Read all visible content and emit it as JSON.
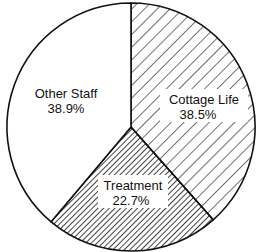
{
  "chart_data": {
    "type": "pie",
    "title": "",
    "start_angle_deg": 0,
    "direction": "clockwise",
    "categories": [
      "Cottage Life",
      "Treatment",
      "Other Staff"
    ],
    "values": [
      38.5,
      22.7,
      38.9
    ],
    "unit": "%",
    "slices": [
      {
        "label": "Cottage Life",
        "value": 38.5,
        "value_text": "38.5%",
        "fill": "sparse-diagonal-hatch"
      },
      {
        "label": "Treatment",
        "value": 22.7,
        "value_text": "22.7%",
        "fill": "dense-diagonal-hatch"
      },
      {
        "label": "Other Staff",
        "value": 38.9,
        "value_text": "38.9%",
        "fill": "white"
      }
    ],
    "legend": "none (labels inside slices)"
  },
  "colors": {
    "stroke": "#111111",
    "background": "#ffffff",
    "hatch": "#111111"
  }
}
